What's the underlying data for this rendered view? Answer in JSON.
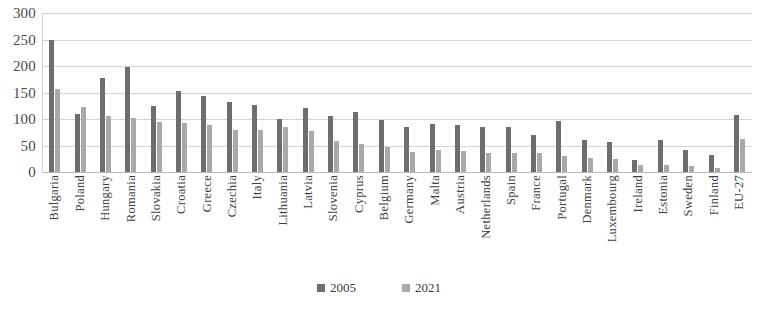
{
  "chart_data": {
    "type": "bar",
    "title": "",
    "subtitle": "",
    "xlabel": "",
    "ylabel": "",
    "ylim": [
      0,
      300
    ],
    "yticks": [
      300,
      250,
      200,
      150,
      100,
      50,
      0
    ],
    "grid": true,
    "legend_position": "bottom",
    "categories": [
      "Bulgaria",
      "Poland",
      "Hungary",
      "Romania",
      "Slovakia",
      "Croatia",
      "Greece",
      "Czechia",
      "Italy",
      "Lithuania",
      "Latvia",
      "Slovenia",
      "Cyprus",
      "Belgium",
      "Germany",
      "Malta",
      "Austria",
      "Netherlands",
      "Spain",
      "France",
      "Portugal",
      "Denmark",
      "Luxembourg",
      "Ireland",
      "Estonia",
      "Sweden",
      "Finland",
      "EU-27"
    ],
    "series": [
      {
        "name": "2005",
        "color": "#6e6e6e",
        "values": [
          250,
          110,
          178,
          199,
          125,
          152,
          143,
          132,
          126,
          100,
          120,
          106,
          113,
          98,
          85,
          90,
          88,
          85,
          85,
          70,
          97,
          60,
          57,
          23,
          60,
          42,
          32,
          107
        ]
      },
      {
        "name": "2021",
        "color": "#a9a9a9",
        "values": [
          157,
          122,
          105,
          101,
          95,
          92,
          88,
          80,
          79,
          84,
          77,
          58,
          53,
          48,
          38,
          42,
          40,
          36,
          36,
          35,
          30,
          27,
          25,
          14,
          13,
          11,
          8,
          62
        ]
      }
    ]
  }
}
